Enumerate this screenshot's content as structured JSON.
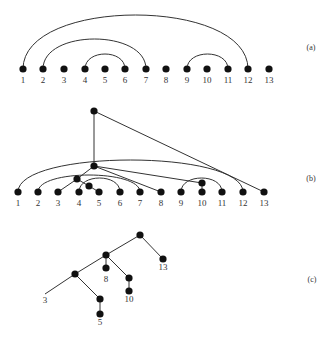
{
  "panels": [
    {
      "id": "a",
      "label": "(a)",
      "label_pos": [
        311,
        50
      ],
      "nodes": [
        {
          "id": "1",
          "x": 23,
          "y": 69,
          "label": "1"
        },
        {
          "id": "2",
          "x": 43,
          "y": 69,
          "label": "2"
        },
        {
          "id": "3",
          "x": 64,
          "y": 69,
          "label": "3"
        },
        {
          "id": "4",
          "x": 85,
          "y": 69,
          "label": "4"
        },
        {
          "id": "5",
          "x": 105,
          "y": 69,
          "label": "5"
        },
        {
          "id": "6",
          "x": 125,
          "y": 69,
          "label": "6"
        },
        {
          "id": "7",
          "x": 146,
          "y": 69,
          "label": "7"
        },
        {
          "id": "8",
          "x": 166,
          "y": 69,
          "label": "8"
        },
        {
          "id": "9",
          "x": 187,
          "y": 69,
          "label": "9"
        },
        {
          "id": "10",
          "x": 207,
          "y": 69,
          "label": "10"
        },
        {
          "id": "11",
          "x": 228,
          "y": 69,
          "label": "11"
        },
        {
          "id": "12",
          "x": 248,
          "y": 69,
          "label": "12"
        },
        {
          "id": "13",
          "x": 269,
          "y": 69,
          "label": "13"
        }
      ],
      "label_y": 83,
      "arcs": [
        {
          "from": "1",
          "to": "12",
          "peak_y": 15
        },
        {
          "from": "2",
          "to": "7",
          "peak_y": 39
        },
        {
          "from": "4",
          "to": "6",
          "peak_y": 54
        },
        {
          "from": "9",
          "to": "11",
          "peak_y": 54
        }
      ]
    },
    {
      "id": "b",
      "label": "(b)",
      "label_pos": [
        311,
        181
      ],
      "label_y": 206,
      "nodes": [
        {
          "id": "1",
          "x": 18,
          "y": 192,
          "label": "1"
        },
        {
          "id": "2",
          "x": 38,
          "y": 192,
          "label": "2"
        },
        {
          "id": "3",
          "x": 58,
          "y": 192,
          "label": "3"
        },
        {
          "id": "4",
          "x": 79,
          "y": 192,
          "label": "4"
        },
        {
          "id": "5",
          "x": 99,
          "y": 192,
          "label": "5"
        },
        {
          "id": "6",
          "x": 120,
          "y": 192,
          "label": "6"
        },
        {
          "id": "7",
          "x": 140,
          "y": 192,
          "label": "7"
        },
        {
          "id": "8",
          "x": 161,
          "y": 192,
          "label": "8"
        },
        {
          "id": "9",
          "x": 181,
          "y": 192,
          "label": "9"
        },
        {
          "id": "10",
          "x": 202,
          "y": 192,
          "label": "10"
        },
        {
          "id": "11",
          "x": 222,
          "y": 192,
          "label": "11"
        },
        {
          "id": "12",
          "x": 243,
          "y": 192,
          "label": "12"
        },
        {
          "id": "13",
          "x": 264,
          "y": 192,
          "label": "13"
        },
        {
          "id": "T",
          "x": 94,
          "y": 111,
          "label": ""
        },
        {
          "id": "M",
          "x": 94,
          "y": 166,
          "label": ""
        },
        {
          "id": "P",
          "x": 77,
          "y": 179,
          "label": ""
        },
        {
          "id": "R",
          "x": 89,
          "y": 186,
          "label": ""
        },
        {
          "id": "Q",
          "x": 202,
          "y": 183,
          "label": ""
        }
      ],
      "arcs": [
        {
          "from": "1",
          "to": "12",
          "peak_y": 160
        },
        {
          "from": "2",
          "to": "7",
          "peak_y": 175
        },
        {
          "from": "4",
          "to": "6",
          "peak_y": 178
        },
        {
          "from": "9",
          "to": "11",
          "peak_y": 178
        }
      ],
      "edges": [
        {
          "from": "T",
          "to": "M"
        },
        {
          "from": "T",
          "to": "13"
        },
        {
          "from": "M",
          "to": "P"
        },
        {
          "from": "M",
          "to": "8"
        },
        {
          "from": "M",
          "to": "Q"
        },
        {
          "from": "P",
          "to": "3"
        },
        {
          "from": "P",
          "to": "R"
        },
        {
          "from": "R",
          "to": "5"
        },
        {
          "from": "Q",
          "to": "10"
        }
      ]
    },
    {
      "id": "c",
      "label": "(c)",
      "label_pos": [
        312,
        282
      ],
      "nodes": [
        {
          "id": "root",
          "x": 140,
          "y": 235,
          "label": "",
          "dot": true
        },
        {
          "id": "A",
          "x": 106,
          "y": 255,
          "label": "",
          "dot": true
        },
        {
          "id": "B",
          "x": 75,
          "y": 274,
          "label": "",
          "dot": true
        },
        {
          "id": "13",
          "x": 163,
          "y": 259,
          "label": "13",
          "lx": 163,
          "ly": 270,
          "dot": true
        },
        {
          "id": "8",
          "x": 106,
          "y": 268,
          "label": "8",
          "lx": 106,
          "ly": 282,
          "dot": true
        },
        {
          "id": "C",
          "x": 129,
          "y": 278,
          "label": "",
          "dot": true
        },
        {
          "id": "10",
          "x": 129,
          "y": 291,
          "label": "10",
          "lx": 129,
          "ly": 302,
          "dot": true
        },
        {
          "id": "3",
          "x": 45,
          "y": 294,
          "label": "3",
          "lx": 45,
          "ly": 303,
          "dot": false
        },
        {
          "id": "D",
          "x": 100,
          "y": 299,
          "label": "",
          "dot": true
        },
        {
          "id": "5",
          "x": 100,
          "y": 314,
          "label": "5",
          "lx": 100,
          "ly": 325,
          "dot": true
        }
      ],
      "edges": [
        {
          "from": "root",
          "to": "A"
        },
        {
          "from": "root",
          "to": "13"
        },
        {
          "from": "A",
          "to": "B"
        },
        {
          "from": "A",
          "to": "8"
        },
        {
          "from": "A",
          "to": "C"
        },
        {
          "from": "C",
          "to": "10"
        },
        {
          "from": "B",
          "to": "3"
        },
        {
          "from": "B",
          "to": "D"
        },
        {
          "from": "D",
          "to": "5"
        }
      ]
    }
  ],
  "style": {
    "stroke": "#333333",
    "node_fill": "#111111",
    "node_radius": 3.6,
    "text_color": "#333333"
  }
}
